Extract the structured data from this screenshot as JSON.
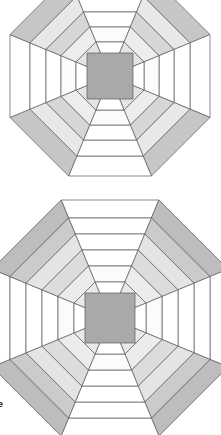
{
  "page": {
    "background_color": "#ffffff",
    "width": 221,
    "height": 435
  },
  "palette": {
    "white": "#ffffff",
    "light_gray": "#ececec",
    "pale_gray": "#f2f2f2",
    "medium_gray": "#cfcfcf",
    "dark_gray": "#b4b4b4",
    "center_fill": "#a9a9a9",
    "stroke": "#5a5a5a",
    "text": "#1a1a1a"
  },
  "stray_text": {
    "fragment": "e"
  },
  "figures": [
    {
      "name": "octagon-block-top",
      "label": "Top octagon pineapple block",
      "center_x": 110,
      "center_y": 76,
      "clipped_top": true,
      "ring_count": 5,
      "center_square": {
        "size": 46,
        "fill": "#a9a9a9"
      },
      "rings": [
        {
          "index": 1,
          "radius": 34,
          "straight_fill": "#ffffff",
          "diagonal_fill": "#e4e4e4"
        },
        {
          "index": 2,
          "radius": 49,
          "straight_fill": "#fbfbfb",
          "diagonal_fill": "#ededed"
        },
        {
          "index": 3,
          "radius": 64,
          "straight_fill": "#ffffff",
          "diagonal_fill": "#d6d6d6"
        },
        {
          "index": 4,
          "radius": 80,
          "straight_fill": "#ffffff",
          "diagonal_fill": "#e8e8e8"
        },
        {
          "index": 5,
          "radius": 100,
          "straight_fill": "#ffffff",
          "diagonal_fill": "#c6c6c6"
        }
      ]
    },
    {
      "name": "octagon-block-bottom",
      "label": "Bottom octagon pineapple block",
      "center_x": 110,
      "center_y": 318,
      "clipped_top": false,
      "clipped_sides": true,
      "ring_count": 6,
      "center_square": {
        "size": 50,
        "fill": "#a9a9a9"
      },
      "rings": [
        {
          "index": 1,
          "radius": 36,
          "straight_fill": "#ffffff",
          "diagonal_fill": "#e9e9e9"
        },
        {
          "index": 2,
          "radius": 52,
          "straight_fill": "#fbfbfb",
          "diagonal_fill": "#ececec"
        },
        {
          "index": 3,
          "radius": 68,
          "straight_fill": "#ffffff",
          "diagonal_fill": "#dcdcdc"
        },
        {
          "index": 4,
          "radius": 84,
          "straight_fill": "#ffffff",
          "diagonal_fill": "#e4e4e4"
        },
        {
          "index": 5,
          "radius": 100,
          "straight_fill": "#ffffff",
          "diagonal_fill": "#cbcbcb"
        },
        {
          "index": 6,
          "radius": 118,
          "straight_fill": "#ffffff",
          "diagonal_fill": "#bdbdbd"
        }
      ]
    }
  ]
}
